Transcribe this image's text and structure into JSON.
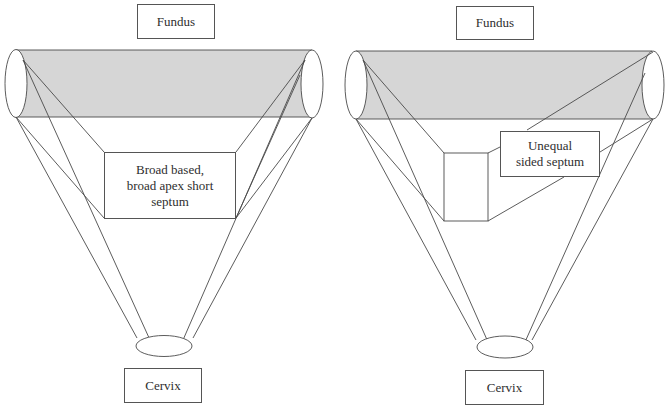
{
  "figure": {
    "panels": [
      {
        "id": "left",
        "top_label": "Fundus",
        "bottom_label": "Cervix",
        "septum_label": "Broad based,\nbroad apex short\nseptum"
      },
      {
        "id": "right",
        "top_label": "Fundus",
        "bottom_label": "Cervix",
        "septum_label": "Unequal\nsided septum"
      }
    ],
    "colors": {
      "fundus_band_fill": "#d6d6d6",
      "stroke": "#4a4a4a",
      "background": "#ffffff"
    }
  }
}
